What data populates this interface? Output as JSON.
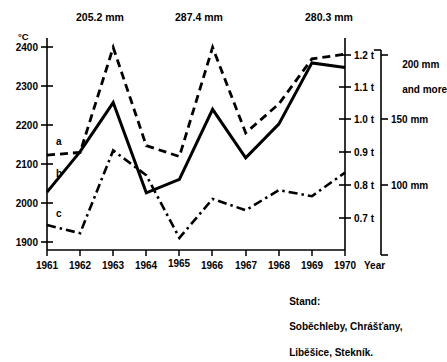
{
  "chart_data": {
    "type": "line",
    "title": "",
    "subtitle": "",
    "xlabel": "Year",
    "ylabel": "°C",
    "grid": false,
    "legend_position": "inline-series-labels",
    "categories": [
      1961,
      1962,
      1963,
      1964,
      1965,
      1966,
      1967,
      1968,
      1969,
      1970
    ],
    "x": [
      1961,
      1962,
      1963,
      1964,
      1965,
      1966,
      1967,
      1968,
      1969,
      1970
    ],
    "xlim": [
      1961,
      1970
    ],
    "axes": [
      {
        "id": "left",
        "side": "left",
        "unit": "°C",
        "unit_label": "°C",
        "ticks": [
          1900,
          2000,
          2100,
          2200,
          2300,
          2400
        ],
        "tick_labels": [
          "1900",
          "2000",
          "2100",
          "2200",
          "2300",
          "2400"
        ],
        "range": [
          1830,
          2460
        ]
      },
      {
        "id": "right-yield",
        "side": "right",
        "unit": "t",
        "ticks": [
          0.7,
          0.8,
          0.9,
          1.0,
          1.1,
          1.2
        ],
        "tick_labels": [
          "0.7 t",
          "0.8 t",
          "0.9 t",
          "1.0 t",
          "1.1 t",
          "1.2 t"
        ],
        "range": [
          0.58,
          1.26
        ]
      },
      {
        "id": "right-rainfall",
        "side": "far-right",
        "unit": "mm",
        "ticks": [
          100,
          150,
          200
        ],
        "tick_labels": [
          "100 mm",
          "150 mm",
          "200 mm\nand more"
        ],
        "top_label_line1": "200 mm",
        "top_label_line2": "and more"
      }
    ],
    "series": [
      {
        "name": "a",
        "label": "a",
        "style": "dashed",
        "axis": "left",
        "values": [
          2112,
          2120,
          2432,
          2140,
          2108,
          2432,
          2178,
          2264,
          2398,
          2412
        ]
      },
      {
        "name": "b",
        "label": "b",
        "style": "solid",
        "axis": "left",
        "values": [
          2002,
          2122,
          2268,
          2000,
          2040,
          2248,
          2104,
          2204,
          2386,
          2372
        ]
      },
      {
        "name": "c",
        "label": "c",
        "style": "dash-dot",
        "axis": "left",
        "values": [
          1904,
          1880,
          2126,
          2052,
          1866,
          1982,
          1948,
          2008,
          1990,
          2060
        ]
      }
    ],
    "annotations": [
      {
        "text": "205.2 mm",
        "x": 1963,
        "series": "a",
        "position": "above-peak"
      },
      {
        "text": "287.4 mm",
        "x": 1966,
        "series": "a",
        "position": "above-peak"
      },
      {
        "text": "280.3 mm",
        "x": 1970,
        "series": "a",
        "position": "above-peak"
      }
    ],
    "caption": {
      "line1": "Stand:",
      "line2": "Soběchleby, Chrášťany,",
      "line3": "Liběšice, Stekník."
    }
  },
  "axis_labels": {
    "y_unit": "°C",
    "x_unit": "Year"
  },
  "colors": {
    "ink": "#000000",
    "background": "#ffffff"
  }
}
